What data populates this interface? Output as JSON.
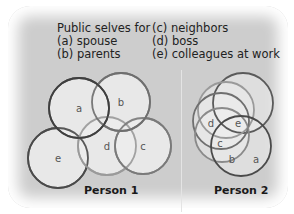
{
  "legend": {
    "title": "Public selves for",
    "items": [
      {
        "key": "a",
        "label": "(a) spouse"
      },
      {
        "key": "b",
        "label": "(b) parents"
      },
      {
        "key": "c",
        "label": "(c) neighbors"
      },
      {
        "key": "d",
        "label": "(d) boss"
      },
      {
        "key": "e",
        "label": "(e) colleagues at work"
      }
    ]
  },
  "person1": {
    "caption": "Person 1",
    "circles": [
      {
        "label": "e",
        "cx": 58,
        "cy": 158,
        "r": 30,
        "stroke": "#4a4a4a"
      },
      {
        "label": "d",
        "cx": 107,
        "cy": 146,
        "r": 29,
        "stroke": "#9a9a9a"
      },
      {
        "label": "c",
        "cx": 143,
        "cy": 146,
        "r": 28,
        "stroke": "#7a7a7a"
      },
      {
        "label": "b",
        "cx": 121,
        "cy": 102,
        "r": 29,
        "stroke": "#6f6f6f"
      },
      {
        "label": "a",
        "cx": 79,
        "cy": 108,
        "r": 30,
        "stroke": "#3f3f3f"
      }
    ]
  },
  "person2": {
    "caption": "Person 2",
    "circles": [
      {
        "cx": 243,
        "cy": 103,
        "r": 30,
        "stroke": "#5a5a5a"
      },
      {
        "cx": 226,
        "cy": 110,
        "r": 28,
        "stroke": "#9a9a9a"
      },
      {
        "cx": 221,
        "cy": 121,
        "r": 28,
        "stroke": "#6f6f6f"
      },
      {
        "cx": 222,
        "cy": 135,
        "r": 27,
        "stroke": "#8a8a8a"
      },
      {
        "cx": 241,
        "cy": 146,
        "r": 30,
        "stroke": "#4a4a4a"
      }
    ],
    "labels": [
      {
        "label": "d",
        "x": 211,
        "y": 127
      },
      {
        "label": "e",
        "x": 238,
        "y": 127
      },
      {
        "label": "c",
        "x": 220,
        "y": 147
      },
      {
        "label": "b",
        "x": 232,
        "y": 163
      },
      {
        "label": "a",
        "x": 256,
        "y": 163
      }
    ]
  },
  "colors": {
    "background": "#cdcdcd",
    "circle_fill": "#ececec",
    "label": "#555555"
  }
}
